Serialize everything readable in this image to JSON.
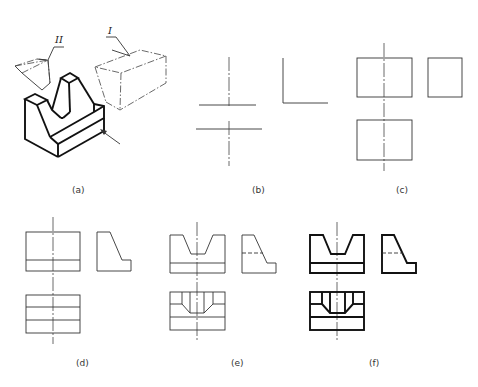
{
  "figure": {
    "panels": [
      {
        "id": "a",
        "caption": "(a)",
        "description": "Isometric view of part with removed prism II (V-notch) and box I, viewing-direction arrow"
      },
      {
        "id": "b",
        "caption": "(b)",
        "description": "Layout of center lines and reference lines"
      },
      {
        "id": "c",
        "caption": "(c)",
        "description": "Bounding rectangles of the three views"
      },
      {
        "id": "d",
        "caption": "(d)",
        "description": "Base plate and sloped side added"
      },
      {
        "id": "e",
        "caption": "(e)",
        "description": "V-notch added with hidden line in side view"
      },
      {
        "id": "f",
        "caption": "(f)",
        "description": "Final views with thickened outlines"
      }
    ],
    "part_labels": {
      "removed_box": "I",
      "removed_prism": "II"
    }
  }
}
